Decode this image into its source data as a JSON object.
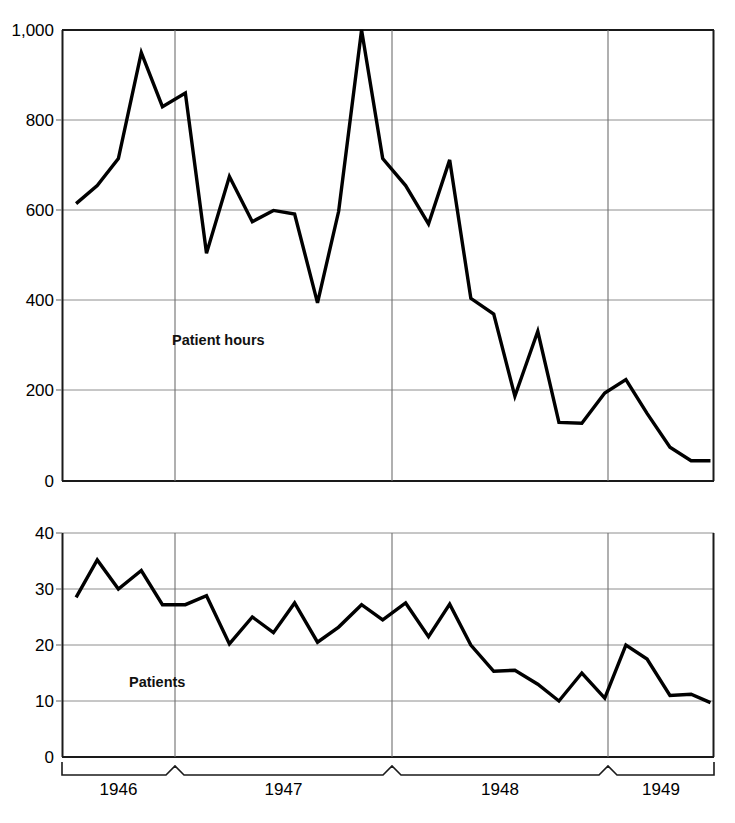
{
  "figure": {
    "name": "patient-hours-and-patients-time-series",
    "panels": [
      {
        "id": "patient-hours",
        "label": "Patient hours"
      },
      {
        "id": "patients",
        "label": "Patients"
      }
    ],
    "x_axis": {
      "type": "year-bracket",
      "year_labels": [
        "1946",
        "1947",
        "1948",
        "1949"
      ],
      "boundaries_px": [
        62,
        175,
        392,
        608,
        714
      ]
    }
  },
  "chart_data": [
    {
      "type": "line",
      "title": "",
      "xlabel": "",
      "ylabel": "Patient hours",
      "annotation": "Patient hours",
      "grid": true,
      "legend": "none",
      "ylim": [
        0,
        1000
      ],
      "yticks": [
        0,
        200,
        400,
        600,
        800,
        1000
      ],
      "ytick_labels": [
        "0",
        "200",
        "400",
        "600",
        "800",
        "1,000"
      ],
      "xlim_years": [
        1945.5,
        1949.2
      ],
      "xtick_labels": [
        "1946",
        "1947",
        "1948",
        "1949"
      ],
      "x": [
        1945.58,
        1945.7,
        1945.82,
        1945.95,
        1946.07,
        1946.2,
        1946.32,
        1946.45,
        1946.58,
        1946.7,
        1946.82,
        1946.95,
        1947.07,
        1947.2,
        1947.32,
        1947.45,
        1947.58,
        1947.7,
        1947.82,
        1947.95,
        1948.07,
        1948.2,
        1948.32,
        1948.45,
        1948.58,
        1948.7,
        1948.82,
        1948.95,
        1949.07,
        1949.18
      ],
      "values": [
        615,
        655,
        715,
        950,
        830,
        860,
        505,
        675,
        575,
        600,
        592,
        395,
        598,
        1000,
        715,
        655,
        570,
        712,
        405,
        370,
        188,
        332,
        130,
        128,
        195,
        225,
        150,
        75,
        45,
        45
      ],
      "n_points": 30
    },
    {
      "type": "line",
      "title": "",
      "xlabel": "",
      "ylabel": "Patients",
      "annotation": "Patients",
      "grid": true,
      "legend": "none",
      "ylim": [
        0,
        40
      ],
      "yticks": [
        0,
        10,
        20,
        30,
        40
      ],
      "ytick_labels": [
        "0",
        "10",
        "20",
        "30",
        "40"
      ],
      "xlim_years": [
        1945.5,
        1949.2
      ],
      "xtick_labels": [
        "1946",
        "1947",
        "1948",
        "1949"
      ],
      "x": [
        1945.58,
        1945.7,
        1945.82,
        1945.95,
        1946.07,
        1946.2,
        1946.32,
        1946.45,
        1946.58,
        1946.7,
        1946.82,
        1946.95,
        1947.07,
        1947.2,
        1947.32,
        1947.45,
        1947.58,
        1947.7,
        1947.82,
        1947.95,
        1948.07,
        1948.2,
        1948.32,
        1948.45,
        1948.58,
        1948.7,
        1948.82,
        1948.95,
        1949.07,
        1949.18
      ],
      "values": [
        28.5,
        35.2,
        30.0,
        33.3,
        27.2,
        27.2,
        28.8,
        20.2,
        25.0,
        22.2,
        27.5,
        20.5,
        23.2,
        27.2,
        24.5,
        27.5,
        21.5,
        27.3,
        20.0,
        15.3,
        15.5,
        13.0,
        10.0,
        15.0,
        10.5,
        20.0,
        17.5,
        11.0,
        11.2,
        9.7
      ],
      "n_points": 30
    }
  ]
}
